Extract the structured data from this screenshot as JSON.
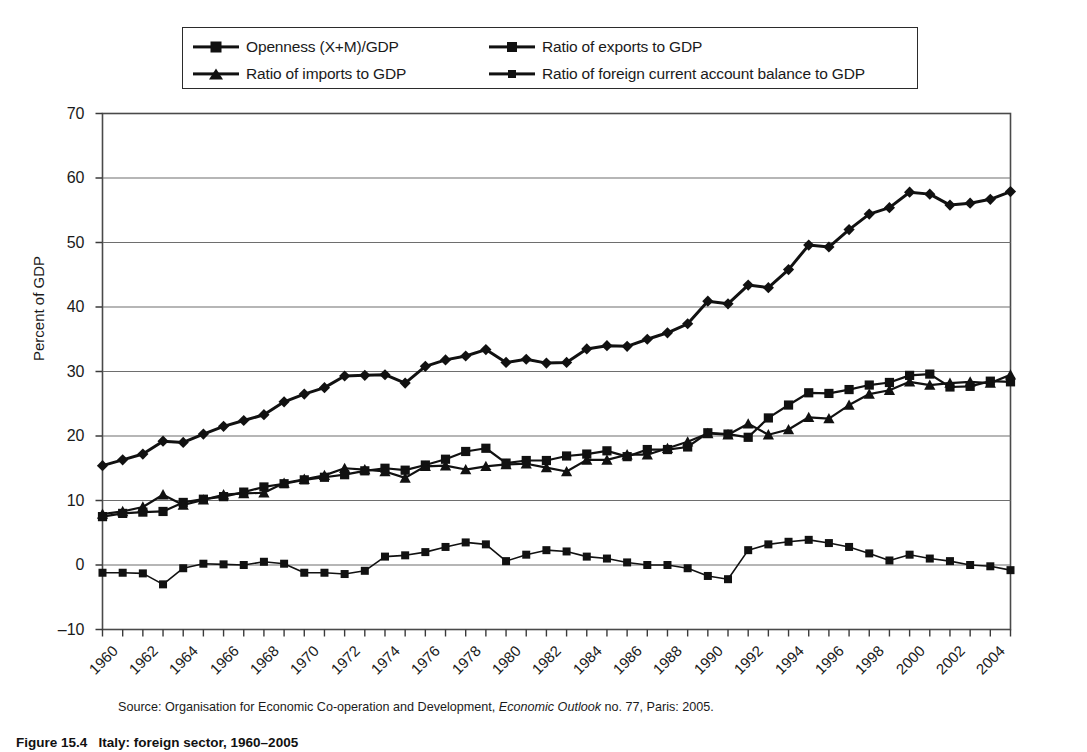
{
  "figure": {
    "caption_number": "Figure 15.4",
    "caption_text": "Italy: foreign sector, 1960–2005",
    "source_prefix": "Source: Organisation for Economic Co-operation and Development, ",
    "source_italic": "Economic Outlook",
    "source_suffix": " no. 77, Paris: 2005."
  },
  "legend": {
    "items": [
      {
        "label": "Openness (X+M)/GDP",
        "marker": "diamond-marker"
      },
      {
        "label": "Ratio of exports to GDP",
        "marker": "square-marker"
      },
      {
        "label": "Ratio of imports to GDP",
        "marker": "triangle-marker"
      },
      {
        "label": "Ratio of foreign current account balance to GDP",
        "marker": "small-square-marker"
      }
    ]
  },
  "chart_data": {
    "type": "line",
    "title": "",
    "xlabel": "",
    "ylabel": "Percent of GDP",
    "ylim": [
      -10,
      70
    ],
    "yticks": [
      -10,
      0,
      10,
      20,
      30,
      40,
      50,
      60,
      70
    ],
    "grid": "horizontal",
    "legend_position": "top",
    "xlim": [
      1960,
      2005
    ],
    "x": [
      1960,
      1961,
      1962,
      1963,
      1964,
      1965,
      1966,
      1967,
      1968,
      1969,
      1970,
      1971,
      1972,
      1973,
      1974,
      1975,
      1976,
      1977,
      1978,
      1979,
      1980,
      1981,
      1982,
      1983,
      1984,
      1985,
      1986,
      1987,
      1988,
      1989,
      1990,
      1991,
      1992,
      1993,
      1994,
      1995,
      1996,
      1997,
      1998,
      1999,
      2000,
      2001,
      2002,
      2003,
      2004,
      2005
    ],
    "xtick_labels": [
      "1960",
      "1962",
      "1964",
      "1966",
      "1968",
      "1970",
      "1972",
      "1974",
      "1976",
      "1978",
      "1980",
      "1982",
      "1984",
      "1986",
      "1988",
      "1990",
      "1992",
      "1994",
      "1996",
      "1998",
      "2000",
      "2002",
      "2004"
    ],
    "series": [
      {
        "name": "Openness (X+M)/GDP",
        "marker": "diamond",
        "values": [
          15.4,
          16.3,
          17.2,
          19.2,
          19.0,
          20.3,
          21.5,
          22.4,
          23.3,
          25.3,
          26.5,
          27.5,
          29.3,
          29.4,
          29.5,
          28.2,
          30.8,
          31.8,
          32.4,
          33.4,
          31.4,
          31.9,
          31.3,
          31.4,
          33.5,
          34.0,
          33.9,
          35.0,
          36.0,
          37.4,
          40.9,
          40.5,
          43.4,
          43.0,
          45.8,
          49.6,
          49.3,
          52.0,
          54.4,
          55.4,
          57.8,
          57.5,
          55.8,
          56.1,
          56.7,
          57.9
        ]
      },
      {
        "name": "Ratio of exports to GDP",
        "marker": "square",
        "values": [
          7.5,
          8.0,
          8.2,
          8.3,
          9.7,
          10.2,
          10.6,
          11.3,
          12.1,
          12.6,
          13.2,
          13.6,
          14.0,
          14.6,
          15.0,
          14.7,
          15.5,
          16.4,
          17.6,
          18.1,
          15.8,
          16.2,
          16.2,
          16.9,
          17.2,
          17.7,
          16.8,
          17.9,
          17.9,
          18.3,
          20.5,
          20.3,
          19.8,
          22.8,
          24.8,
          26.7,
          26.6,
          27.2,
          27.9,
          28.3,
          29.4,
          29.6,
          27.6,
          27.7,
          28.5,
          28.4
        ]
      },
      {
        "name": "Ratio of imports to GDP",
        "marker": "triangle",
        "values": [
          7.9,
          8.3,
          9.0,
          10.9,
          9.3,
          10.1,
          10.9,
          11.1,
          11.2,
          12.7,
          13.3,
          13.9,
          15.0,
          14.8,
          14.5,
          13.5,
          15.3,
          15.4,
          14.8,
          15.3,
          15.6,
          15.7,
          15.1,
          14.5,
          16.3,
          16.3,
          17.1,
          17.1,
          18.1,
          19.1,
          20.4,
          20.2,
          21.9,
          20.2,
          21.0,
          22.9,
          22.7,
          24.8,
          26.5,
          27.1,
          28.4,
          27.9,
          28.2,
          28.4,
          28.2,
          29.5
        ]
      },
      {
        "name": "Ratio of foreign current account balance to GDP",
        "marker": "small-square",
        "values": [
          -1.2,
          -1.2,
          -1.3,
          -3.0,
          -0.5,
          0.2,
          0.1,
          0.0,
          0.5,
          0.2,
          -1.2,
          -1.2,
          -1.4,
          -0.9,
          1.3,
          1.5,
          2.0,
          2.8,
          3.5,
          3.2,
          0.6,
          1.6,
          2.3,
          2.1,
          1.3,
          1.0,
          0.4,
          0.0,
          0.0,
          -0.5,
          -1.7,
          -2.2,
          2.3,
          3.2,
          3.6,
          3.9,
          3.4,
          2.8,
          1.8,
          0.7,
          1.6,
          1.0,
          0.6,
          0.0,
          -0.2,
          -0.8
        ]
      }
    ]
  },
  "axis": {
    "y_title": "Percent of GDP"
  }
}
